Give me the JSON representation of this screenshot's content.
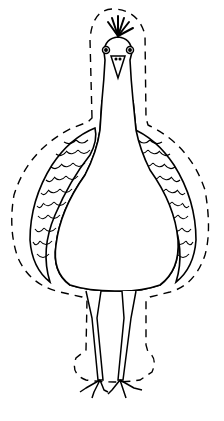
{
  "image": {
    "description": "Black line drawing of a peacock (front view) with a dashed cut-out outline",
    "subject": "peacock",
    "style": "coloring-page line art",
    "stroke_color": "#000000",
    "background_color": "#ffffff"
  }
}
